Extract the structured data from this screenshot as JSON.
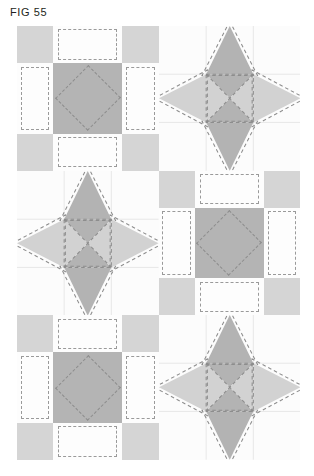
{
  "figure": {
    "label": "FIG 55",
    "type": "patent-line-drawing"
  },
  "colors": {
    "page_background": "#ffffff",
    "block_background": "#fcfcfc",
    "light_gray_patch": "#d5d5d5",
    "medium_gray_patch": "#b4b4b4",
    "star_point_light": "#d2d2d2",
    "star_point_dark": "#b3b3b3",
    "grid_line": "#e3e3e3",
    "stitch_dash": "#8d8d8d",
    "title_text": "#231f20"
  },
  "layout": {
    "columns": 2,
    "rows": 3,
    "blocks": [
      {
        "position": "row1-col1",
        "kind": "nine-patch"
      },
      {
        "position": "row1-col2",
        "kind": "star"
      },
      {
        "position": "row2-col1",
        "kind": "star"
      },
      {
        "position": "row2-col2",
        "kind": "nine-patch"
      },
      {
        "position": "row3-col1",
        "kind": "nine-patch"
      },
      {
        "position": "row3-col2",
        "kind": "star"
      }
    ]
  },
  "nine_patch": {
    "grid": "3x3",
    "corner_fill": "light_gray_patch",
    "edge_fill": "block_background",
    "center_fill": "medium_gray_patch",
    "center_motif": "dashed diamond rotated 45 degrees",
    "edge_motif": "dashed inset rectangle"
  },
  "star_block": {
    "grid": "3x3",
    "points": 4,
    "vertical_points_fill": "star_point_dark",
    "horizontal_points_fill": "star_point_light",
    "center_motif": "hourglass X of four triangles with dashed square and dashed diagonals",
    "seam_allowance": "dashed outline offset outside each star point"
  }
}
